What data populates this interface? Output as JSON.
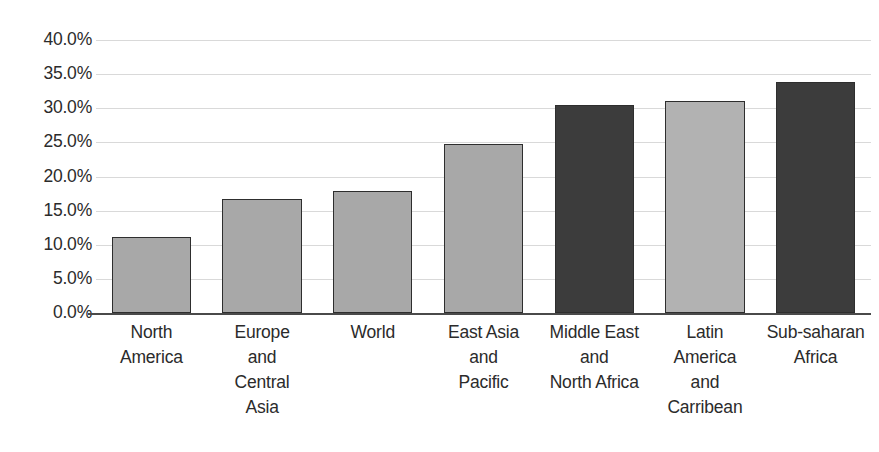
{
  "chart_data": {
    "type": "bar",
    "title": "",
    "subtitle": "",
    "xlabel": "",
    "ylabel": "",
    "ylim": [
      0,
      0.4
    ],
    "grid": true,
    "legend": "none",
    "value_format": "percent",
    "categories": [
      "North America",
      "Europe and Central Asia",
      "World",
      "East Asia and Pacific",
      "Middle East and North Africa",
      "Latin America and Carribean",
      "Sub-saharan Africa"
    ],
    "category_lines": [
      [
        "North",
        "America"
      ],
      [
        "Europe",
        "and",
        "Central",
        "Asia"
      ],
      [
        "World"
      ],
      [
        "East Asia",
        "and",
        "Pacific"
      ],
      [
        "Middle East",
        "and",
        "North Africa"
      ],
      [
        "Latin",
        "America",
        "and",
        "Carribean"
      ],
      [
        "Sub-saharan",
        "Africa"
      ]
    ],
    "values": [
      0.112,
      0.167,
      0.179,
      0.247,
      0.305,
      0.311,
      0.338
    ],
    "values_percent": [
      "11.2%",
      "16.7%",
      "17.9%",
      "24.7%",
      "30.5%",
      "31.1%",
      "33.8%"
    ],
    "bar_colors": [
      "#a8a8a8",
      "#a8a8a8",
      "#a8a8a8",
      "#a8a8a8",
      "#3c3c3c",
      "#b2b2b2",
      "#3c3c3c"
    ],
    "bar_border_color": "#2e2e2e",
    "ytick_values": [
      0.4,
      0.35,
      0.3,
      0.25,
      0.2,
      0.15,
      0.1,
      0.05,
      0.0
    ],
    "ytick_labels": [
      "40.0%",
      "35.0%",
      "30.0%",
      "25.0%",
      "20.0%",
      "15.0%",
      "10.0%",
      "5.0%",
      "0.0%"
    ],
    "gridline_color": "#d9d9d9",
    "axis_color": "#4a4a4a",
    "background_color": "#ffffff"
  }
}
